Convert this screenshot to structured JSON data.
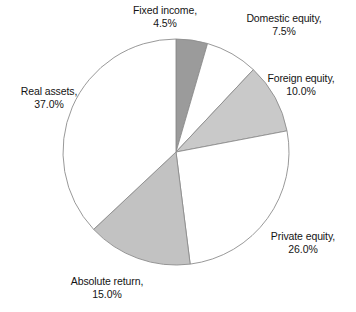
{
  "chart_data": {
    "type": "pie",
    "title": "",
    "subtitle": "",
    "xlabel": "",
    "ylabel": "",
    "legend_position": "none",
    "grid": false,
    "label_format": "{name}, {value}%",
    "start_angle_deg": 0,
    "direction": "clockwise",
    "categories": [
      "Fixed income",
      "Domestic equity",
      "Foreign equity",
      "Private equity",
      "Absolute return",
      "Real assets"
    ],
    "values": [
      4.5,
      7.5,
      10.0,
      26.0,
      15.0,
      37.0
    ],
    "value_labels": [
      "4.5%",
      "7.5%",
      "10.0%",
      "26.0%",
      "15.0%",
      "37.0%"
    ],
    "colors": [
      "#9b9b9b",
      "#ffffff",
      "#c9c9c9",
      "#ffffff",
      "#c2c2c2",
      "#ffffff"
    ],
    "slice_outline_color": "#8d8d8d",
    "slices": [
      {
        "name": "Fixed income",
        "value": 4.5,
        "value_label": "4.5%",
        "label_line1": "Fixed income,",
        "label_line2": "4.5%",
        "color": "#9b9b9b",
        "start_deg": 0,
        "end_deg": 16.2
      },
      {
        "name": "Domestic equity",
        "value": 7.5,
        "value_label": "7.5%",
        "label_line1": "Domestic equity,",
        "label_line2": "7.5%",
        "color": "#ffffff",
        "start_deg": 16.2,
        "end_deg": 43.2
      },
      {
        "name": "Foreign equity",
        "value": 10.0,
        "value_label": "10.0%",
        "label_line1": "Foreign equity,",
        "label_line2": "10.0%",
        "color": "#c9c9c9",
        "start_deg": 43.2,
        "end_deg": 79.2
      },
      {
        "name": "Private equity",
        "value": 26.0,
        "value_label": "26.0%",
        "label_line1": "Private equity,",
        "label_line2": "26.0%",
        "color": "#ffffff",
        "start_deg": 79.2,
        "end_deg": 172.8
      },
      {
        "name": "Absolute return",
        "value": 15.0,
        "value_label": "15.0%",
        "label_line1": "Absolute return,",
        "label_line2": "15.0%",
        "color": "#c2c2c2",
        "start_deg": 172.8,
        "end_deg": 226.8
      },
      {
        "name": "Real assets",
        "value": 37.0,
        "value_label": "37.0%",
        "label_line1": "Real assets,",
        "label_line2": "37.0%",
        "color": "#ffffff",
        "start_deg": 226.8,
        "end_deg": 360
      }
    ],
    "geometry": {
      "center_x": 176,
      "center_y": 152,
      "radius": 113
    }
  }
}
